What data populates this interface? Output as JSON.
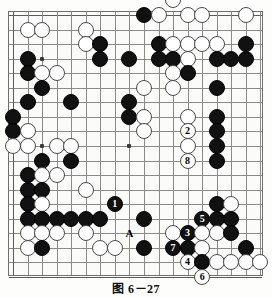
{
  "caption": "图 6－27",
  "board": {
    "type": "go-board",
    "cols": 18,
    "rows": 18,
    "origin_x": 12,
    "origin_y": 14,
    "spacing": 14.55,
    "hoshi": [
      [
        2,
        3
      ],
      [
        8,
        9
      ],
      [
        2,
        9
      ]
    ],
    "stones": [
      {
        "c": 11,
        "r": -1,
        "color": "white"
      },
      {
        "c": 9,
        "r": 0,
        "color": "black"
      },
      {
        "c": 10,
        "r": 0,
        "color": "white"
      },
      {
        "c": 12,
        "r": 0,
        "color": "white"
      },
      {
        "c": 13,
        "r": 0,
        "color": "white"
      },
      {
        "c": 16,
        "r": 0,
        "color": "white"
      },
      {
        "c": 5,
        "r": 1,
        "color": "white"
      },
      {
        "c": 1,
        "r": 1,
        "color": "white"
      },
      {
        "c": 2,
        "r": 1,
        "color": "white"
      },
      {
        "c": 5,
        "r": 2,
        "color": "white"
      },
      {
        "c": 6,
        "r": 2,
        "color": "black"
      },
      {
        "c": 10,
        "r": 2,
        "color": "black"
      },
      {
        "c": 11,
        "r": 2,
        "color": "white"
      },
      {
        "c": 12,
        "r": 2,
        "color": "white"
      },
      {
        "c": 13,
        "r": 2,
        "color": "white"
      },
      {
        "c": 14,
        "r": 2,
        "color": "white"
      },
      {
        "c": 16,
        "r": 2,
        "color": "black"
      },
      {
        "c": 1,
        "r": 3,
        "color": "black"
      },
      {
        "c": 6,
        "r": 3,
        "color": "black"
      },
      {
        "c": 8,
        "r": 3,
        "color": "black"
      },
      {
        "c": 10,
        "r": 3,
        "color": "black"
      },
      {
        "c": 11,
        "r": 3,
        "color": "black"
      },
      {
        "c": 12,
        "r": 3,
        "color": "white"
      },
      {
        "c": 14,
        "r": 3,
        "color": "black"
      },
      {
        "c": 15,
        "r": 3,
        "color": "black"
      },
      {
        "c": 16,
        "r": 3,
        "color": "black"
      },
      {
        "c": 1,
        "r": 4,
        "color": "black"
      },
      {
        "c": 2,
        "r": 4,
        "color": "white"
      },
      {
        "c": 3,
        "r": 4,
        "color": "white"
      },
      {
        "c": 11,
        "r": 4,
        "color": "white"
      },
      {
        "c": 12,
        "r": 4,
        "color": "black"
      },
      {
        "c": 2,
        "r": 5,
        "color": "black"
      },
      {
        "c": 9,
        "r": 5,
        "color": "white"
      },
      {
        "c": 11,
        "r": 5,
        "color": "white"
      },
      {
        "c": 14,
        "r": 5,
        "color": "black"
      },
      {
        "c": 1,
        "r": 6,
        "color": "black"
      },
      {
        "c": 4,
        "r": 6,
        "color": "black"
      },
      {
        "c": 8,
        "r": 6,
        "color": "black"
      },
      {
        "c": 0,
        "r": 7,
        "color": "black"
      },
      {
        "c": 8,
        "r": 7,
        "color": "black"
      },
      {
        "c": 9,
        "r": 7,
        "color": "white"
      },
      {
        "c": 14,
        "r": 7,
        "color": "black"
      },
      {
        "c": 12,
        "r": 7,
        "color": "white"
      },
      {
        "c": 0,
        "r": 8,
        "color": "black"
      },
      {
        "c": 1,
        "r": 8,
        "color": "white"
      },
      {
        "c": 9,
        "r": 8,
        "color": "white"
      },
      {
        "c": 12,
        "r": 8,
        "color": "white",
        "label": "2"
      },
      {
        "c": 14,
        "r": 8,
        "color": "black"
      },
      {
        "c": 0,
        "r": 9,
        "color": "white"
      },
      {
        "c": 1,
        "r": 9,
        "color": "white"
      },
      {
        "c": 3,
        "r": 9,
        "color": "white"
      },
      {
        "c": 4,
        "r": 9,
        "color": "white"
      },
      {
        "c": 12,
        "r": 9,
        "color": "white"
      },
      {
        "c": 14,
        "r": 9,
        "color": "black"
      },
      {
        "c": 2,
        "r": 10,
        "color": "black"
      },
      {
        "c": 4,
        "r": 10,
        "color": "black"
      },
      {
        "c": 12,
        "r": 10,
        "color": "white",
        "label": "8"
      },
      {
        "c": 14,
        "r": 10,
        "color": "black"
      },
      {
        "c": 1,
        "r": 11,
        "color": "black"
      },
      {
        "c": 2,
        "r": 11,
        "color": "white"
      },
      {
        "c": 3,
        "r": 11,
        "color": "white"
      },
      {
        "c": 1,
        "r": 12,
        "color": "black"
      },
      {
        "c": 2,
        "r": 12,
        "color": "black"
      },
      {
        "c": 5,
        "r": 12,
        "color": "white"
      },
      {
        "c": 1,
        "r": 13,
        "color": "black"
      },
      {
        "c": 2,
        "r": 13,
        "color": "white"
      },
      {
        "c": 7,
        "r": 13,
        "color": "black",
        "label": "1"
      },
      {
        "c": 14,
        "r": 13,
        "color": "black"
      },
      {
        "c": 15,
        "r": 13,
        "color": "white"
      },
      {
        "c": 1,
        "r": 14,
        "color": "black"
      },
      {
        "c": 2,
        "r": 14,
        "color": "black"
      },
      {
        "c": 3,
        "r": 14,
        "color": "black"
      },
      {
        "c": 4,
        "r": 14,
        "color": "black"
      },
      {
        "c": 5,
        "r": 14,
        "color": "black"
      },
      {
        "c": 6,
        "r": 14,
        "color": "black"
      },
      {
        "c": 9,
        "r": 14,
        "color": "black"
      },
      {
        "c": 13,
        "r": 14,
        "color": "black",
        "label": "5"
      },
      {
        "c": 14,
        "r": 14,
        "color": "black"
      },
      {
        "c": 15,
        "r": 14,
        "color": "black"
      },
      {
        "c": 1,
        "r": 15,
        "color": "white"
      },
      {
        "c": 2,
        "r": 15,
        "color": "white"
      },
      {
        "c": 3,
        "r": 15,
        "color": "white"
      },
      {
        "c": 5,
        "r": 15,
        "color": "white"
      },
      {
        "c": 11,
        "r": 15,
        "color": "white"
      },
      {
        "c": 12,
        "r": 15,
        "color": "black",
        "label": "3"
      },
      {
        "c": 13,
        "r": 15,
        "color": "white"
      },
      {
        "c": 14,
        "r": 15,
        "color": "white"
      },
      {
        "c": 15,
        "r": 15,
        "color": "black"
      },
      {
        "c": 1,
        "r": 16,
        "color": "white"
      },
      {
        "c": 2,
        "r": 16,
        "color": "black"
      },
      {
        "c": 6,
        "r": 16,
        "color": "white"
      },
      {
        "c": 7,
        "r": 16,
        "color": "white"
      },
      {
        "c": 9,
        "r": 16,
        "color": "black"
      },
      {
        "c": 11,
        "r": 16,
        "color": "black",
        "label": "7"
      },
      {
        "c": 12,
        "r": 16,
        "color": "black"
      },
      {
        "c": 13,
        "r": 16,
        "color": "white"
      },
      {
        "c": 16,
        "r": 16,
        "color": "black"
      },
      {
        "c": 12,
        "r": 17,
        "color": "white",
        "label": "4"
      },
      {
        "c": 13,
        "r": 17,
        "color": "black"
      },
      {
        "c": 14,
        "r": 17,
        "color": "white"
      },
      {
        "c": 15,
        "r": 17,
        "color": "white"
      },
      {
        "c": 16,
        "r": 17,
        "color": "white"
      },
      {
        "c": 17,
        "r": 17,
        "color": "white"
      },
      {
        "c": 13,
        "r": 18,
        "color": "white",
        "label": "6"
      }
    ],
    "markers": [
      {
        "c": 8,
        "r": 15,
        "text": "A"
      }
    ]
  }
}
